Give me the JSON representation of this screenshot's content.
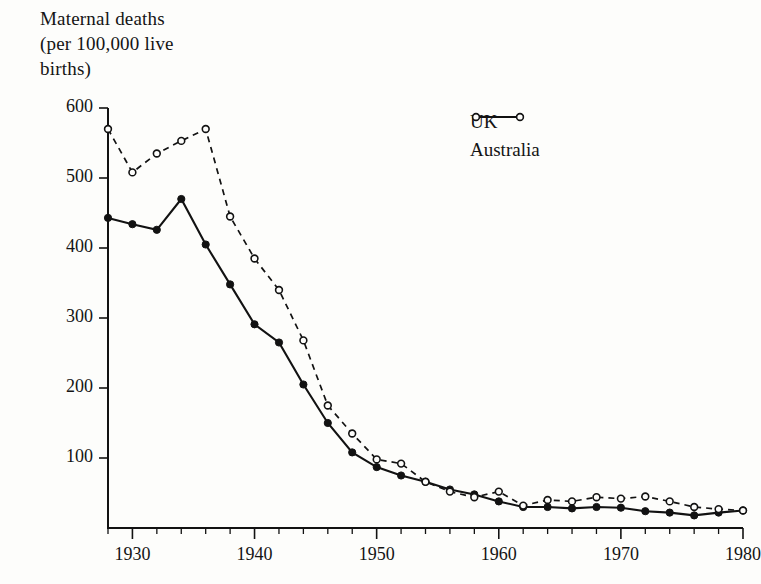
{
  "figure": {
    "axis_title": "Maternal deaths\n(per 100,000 live\nbirths)",
    "background_color": "#fdfdfb",
    "ink_color": "#121212"
  },
  "legend": {
    "position": "upper-right",
    "entries": [
      {
        "label": "UK",
        "marker": "filled-circle",
        "line": "solid"
      },
      {
        "label": "Australia",
        "marker": "open-circle",
        "line": "dashed"
      }
    ]
  },
  "chart_data": {
    "type": "line",
    "title": "Maternal deaths (per 100,000 live births)",
    "xlabel": "",
    "ylabel": "Maternal deaths (per 100,000 live births)",
    "xlim": [
      1928,
      1980
    ],
    "ylim": [
      0,
      600
    ],
    "grid": false,
    "y_ticks": [
      0,
      100,
      200,
      300,
      400,
      500,
      600
    ],
    "y_tick_labels": [
      "",
      "100",
      "200",
      "300",
      "400",
      "500",
      "600"
    ],
    "x_ticks": [
      1930,
      1940,
      1950,
      1960,
      1970,
      1980
    ],
    "x_tick_labels": [
      "1930",
      "1940",
      "1950",
      "1960",
      "1970",
      "1980"
    ],
    "x_minor_tick_interval": 2,
    "legend_position": "upper right",
    "series": [
      {
        "name": "UK",
        "marker": "filled-circle",
        "linestyle": "solid",
        "x": [
          1928,
          1930,
          1932,
          1934,
          1936,
          1938,
          1940,
          1942,
          1944,
          1946,
          1948,
          1950,
          1952,
          1954,
          1956,
          1958,
          1960,
          1962,
          1964,
          1966,
          1968,
          1970,
          1972,
          1974,
          1976,
          1978,
          1980
        ],
        "values": [
          443,
          434,
          426,
          470,
          405,
          348,
          291,
          265,
          205,
          150,
          108,
          87,
          75,
          66,
          55,
          48,
          38,
          30,
          30,
          28,
          30,
          29,
          24,
          22,
          18,
          22,
          25
        ]
      },
      {
        "name": "Australia",
        "marker": "open-circle",
        "linestyle": "dashed",
        "x": [
          1928,
          1930,
          1932,
          1934,
          1936,
          1938,
          1940,
          1942,
          1944,
          1946,
          1948,
          1950,
          1952,
          1954,
          1956,
          1958,
          1960,
          1962,
          1964,
          1966,
          1968,
          1970,
          1972,
          1974,
          1976,
          1978,
          1980
        ],
        "values": [
          570,
          508,
          535,
          553,
          570,
          445,
          385,
          340,
          268,
          175,
          135,
          98,
          92,
          66,
          52,
          44,
          52,
          32,
          40,
          38,
          44,
          42,
          45,
          38,
          30,
          27,
          25
        ]
      }
    ]
  }
}
